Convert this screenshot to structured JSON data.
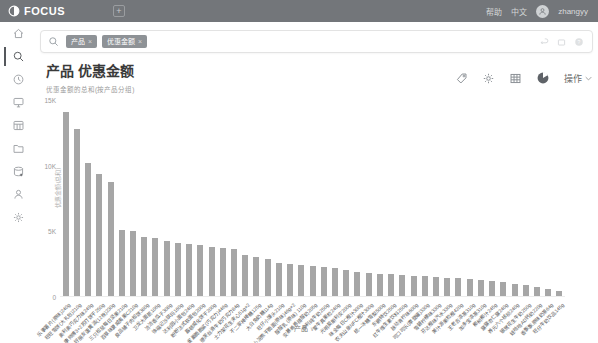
{
  "topbar": {
    "brand": "FOCUS",
    "help": "帮助",
    "lang": "中文",
    "username": "zhangyy"
  },
  "searchbar": {
    "chips": [
      {
        "label": "产品"
      },
      {
        "label": "优惠金额"
      }
    ],
    "close_glyph": "×"
  },
  "sidebar": {
    "items": [
      {
        "name": "home",
        "active": false
      },
      {
        "name": "search",
        "active": true
      },
      {
        "name": "history",
        "active": false
      },
      {
        "name": "dashboard",
        "active": false
      },
      {
        "name": "datatable",
        "active": false
      },
      {
        "name": "folder",
        "active": false
      },
      {
        "name": "datasource",
        "active": false
      },
      {
        "name": "user",
        "active": false
      },
      {
        "name": "settings",
        "active": false
      }
    ]
  },
  "chartHeader": {
    "title": "产品 优惠金额",
    "subtitle": "优惠金额的总和(按产品分组)",
    "actions_label": "操作"
  },
  "chart_data": {
    "type": "bar",
    "title": "产品 优惠金额",
    "xlabel": "产品",
    "ylabel": "优惠金额(总和)",
    "ylim": [
      0,
      15000
    ],
    "bar_color": "#a6a6a6",
    "grid": false,
    "yticks": [
      {
        "v": 0,
        "label": "0"
      },
      {
        "v": 5000,
        "label": "5K"
      },
      {
        "v": 10000,
        "label": "10K"
      },
      {
        "v": 15000,
        "label": "15K"
      }
    ],
    "categories": [
      "乐事薯片(原味)240g",
      "旺旺雪饼(大礼包)210g",
      "奥利奥巧克力味249g",
      "康师傅3+2苏打饼干250g",
      "好丽友蛋黄派(12枚)230g",
      "三只松鼠每日坚果210g",
      "百草味夏威夷果C210g",
      "良品铺子肉松饼380g",
      "卫龙大面筋106g",
      "洽洽香瓜子308g",
      "徐福记沙琪玛160g",
      "达利园小面包240g",
      "盼盼法式软面包200g",
      "嘉顿威化饼干200g",
      "雀巢脆脆鲨(巧克力)446g",
      "德芙丝滑牛奶巧克力84g",
      "士力架花生夹心51g×2",
      "不二家棒棒糖125g",
      "大白兔奶糖114g",
      "旺仔小馒头210g",
      "小浣熊干脆面(原味)46g×2",
      "酸酸乳 (原味) 110g",
      "安慕希希腊酸奶205g",
      "伊利纯牛奶250g",
      "蒙牛真果粒240g",
      "光明莫斯利安200g",
      "味全每日C橙汁300g",
      "农夫山泉NFC橙汁300g",
      "统一冰糖雪梨500g",
      "东鹏特饮250g",
      "红牛维生素饮料250g",
      "脉动青柠味600g",
      "可口可乐(摩登罐)330g",
      "雪碧柠檬味330g",
      "芬达橙味汽水330g",
      "美汁源果粒橙420g",
      "王老吉凉茶310g",
      "加多宝凉茶310g",
      "椰树椰汁245g",
      "露露杏仁露240g",
      "养元六个核桃240g",
      "银鹭花生牛奶250g",
      "娃哈哈AD钙奶220g",
      "香飘飘原味奶茶64g",
      "旺仔牛奶饮品145g"
    ],
    "values": [
      14000,
      12700,
      10100,
      9300,
      8700,
      5000,
      4950,
      4500,
      4400,
      4200,
      4050,
      3950,
      3850,
      3750,
      3650,
      3550,
      3100,
      2950,
      2800,
      2500,
      2400,
      2350,
      2300,
      2200,
      2100,
      1950,
      1850,
      1750,
      1700,
      1650,
      1600,
      1550,
      1500,
      1450,
      1400,
      1350,
      1300,
      1250,
      1150,
      1050,
      950,
      850,
      700,
      550,
      400
    ]
  }
}
